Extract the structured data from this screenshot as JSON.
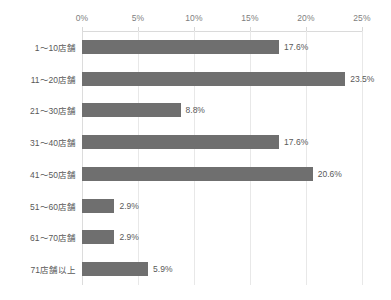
{
  "chart_data": {
    "type": "bar",
    "orientation": "horizontal",
    "title": "",
    "subtitle": "",
    "xlabel": "",
    "ylabel": "",
    "categories": [
      "1〜10店舗",
      "11〜20店舗",
      "21〜30店舗",
      "31〜40店舗",
      "41〜50店舗",
      "51〜60店舗",
      "61〜70店舗",
      "71店舗以上"
    ],
    "values": [
      17.6,
      23.5,
      8.8,
      17.6,
      20.6,
      2.9,
      2.9,
      5.9
    ],
    "data_labels": [
      "17.6%",
      "23.5%",
      "8.8%",
      "17.6%",
      "20.6%",
      "2.9%",
      "2.9%",
      "5.9%"
    ],
    "xlim": [
      0,
      25
    ],
    "xticks": [
      0,
      5,
      10,
      15,
      20,
      25
    ],
    "xtick_labels": [
      "0%",
      "5%",
      "10%",
      "15%",
      "20%",
      "25%"
    ],
    "xaxis_position": "top",
    "grid": true,
    "grid_axis": "x",
    "legend": false,
    "legend_position": "none",
    "colors": {
      "bar": "#6f6f6f",
      "background": "#ffffff",
      "gridline": "#e8e8e8",
      "axis_line": "#dadada",
      "tick_label": "#808080",
      "category_label": "#595959",
      "data_label": "#595959"
    }
  }
}
